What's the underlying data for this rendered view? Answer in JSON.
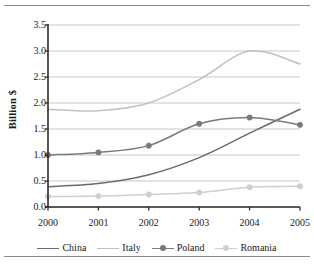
{
  "chart_data": {
    "type": "line",
    "title": "",
    "xlabel": "",
    "ylabel": "Billion $",
    "x": [
      "2000",
      "2001",
      "2002",
      "2003",
      "2004",
      "2005"
    ],
    "ylim": [
      0.0,
      3.5
    ],
    "yticks": [
      "0.0",
      "0.5",
      "1.0",
      "1.5",
      "2.0",
      "2.5",
      "3.0",
      "3.5"
    ],
    "ytick_values": [
      0.0,
      0.5,
      1.0,
      1.5,
      2.0,
      2.5,
      3.0,
      3.5
    ],
    "grid": "horizontal",
    "legend_position": "bottom",
    "smoothing": "spline",
    "series": [
      {
        "name": "China",
        "color": "#6b6b6b",
        "marker": "none",
        "values": [
          0.39,
          0.45,
          0.62,
          0.95,
          1.42,
          1.88
        ]
      },
      {
        "name": "Italy",
        "color": "#c0c0c0",
        "marker": "none",
        "values": [
          1.88,
          1.85,
          2.0,
          2.45,
          3.0,
          2.75
        ]
      },
      {
        "name": "Poland",
        "color": "#7a7a7a",
        "marker": "circle",
        "values": [
          1.0,
          1.05,
          1.18,
          1.6,
          1.72,
          1.58
        ]
      },
      {
        "name": "Romania",
        "color": "#cfcfcf",
        "marker": "circle",
        "values": [
          0.2,
          0.21,
          0.24,
          0.28,
          0.38,
          0.4
        ]
      }
    ]
  },
  "axis": {
    "y_label": "Billion $"
  },
  "legend": {
    "items": [
      {
        "label": "China"
      },
      {
        "label": "Italy"
      },
      {
        "label": "Poland"
      },
      {
        "label": "Romania"
      }
    ]
  }
}
